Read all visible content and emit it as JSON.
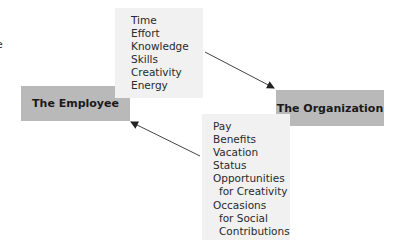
{
  "diagram": {
    "edge_fragment": "e",
    "employee": {
      "label": "The Employee"
    },
    "organization": {
      "label": "The Organization"
    },
    "employee_contributions": {
      "items": [
        "Time",
        "Effort",
        "Knowledge",
        "Skills",
        "Creativity",
        "Energy"
      ]
    },
    "organization_rewards": {
      "items": [
        {
          "text": "Pay",
          "indent": false
        },
        {
          "text": "Benefits",
          "indent": false
        },
        {
          "text": "Vacation",
          "indent": false
        },
        {
          "text": "Status",
          "indent": false
        },
        {
          "text": "Opportunities",
          "indent": false
        },
        {
          "text": "for Creativity",
          "indent": true
        },
        {
          "text": "Occasions",
          "indent": false
        },
        {
          "text": "for Social",
          "indent": true
        },
        {
          "text": " Contributions",
          "indent": true
        }
      ]
    },
    "colors": {
      "entity_fill": "#b9b9b9",
      "list_fill": "#f1f1f1",
      "arrow": "#333333"
    }
  }
}
